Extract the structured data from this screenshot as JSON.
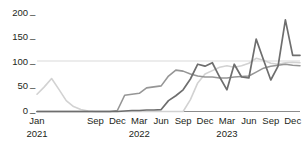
{
  "chart_data": {
    "type": "line",
    "title": "",
    "subtitle": "",
    "xlabel": "",
    "ylabel": "",
    "ylim": [
      0,
      200
    ],
    "yticks": [
      0,
      50,
      100,
      150,
      200
    ],
    "ytick_labels": [
      "0",
      "50",
      "100",
      "150",
      "200"
    ],
    "grid": "horizontal-at-100-only",
    "legend": "none",
    "x": [
      "Jan 2021",
      "Feb 2021",
      "Mar 2021",
      "Apr 2021",
      "May 2021",
      "Jun 2021",
      "Jul 2021",
      "Aug 2021",
      "Sep 2021",
      "Oct 2021",
      "Nov 2021",
      "Dec 2021",
      "Jan 2022",
      "Feb 2022",
      "Mar 2022",
      "Apr 2022",
      "May 2022",
      "Jun 2022",
      "Jul 2022",
      "Aug 2022",
      "Sep 2022",
      "Oct 2022",
      "Nov 2022",
      "Dec 2022",
      "Jan 2023",
      "Feb 2023",
      "Mar 2023",
      "Apr 2023",
      "May 2023",
      "Jun 2023",
      "Jul 2023",
      "Aug 2023",
      "Sep 2023",
      "Oct 2023",
      "Nov 2023",
      "Dec 2023",
      "Jan 2024"
    ],
    "xtick_labels": [
      "Jan",
      "Sep",
      "Dec",
      "Mar",
      "Jun",
      "Sep",
      "Dec",
      "Mar",
      "Jun",
      "Sep",
      "Dec"
    ],
    "xtick_years": [
      "2021",
      "",
      "",
      "2022",
      "",
      "",
      "",
      "2023",
      "",
      "",
      ""
    ],
    "xtick_indices": [
      0,
      8,
      11,
      14,
      17,
      20,
      23,
      26,
      29,
      32,
      35
    ],
    "series": [
      {
        "name": "series-light",
        "color": "#d2d2d2",
        "width": 1.6,
        "values": [
          35,
          50,
          67,
          45,
          22,
          10,
          4,
          1,
          0,
          0,
          0,
          0,
          0,
          0,
          0,
          0,
          0,
          0,
          0,
          0,
          0,
          24,
          58,
          76,
          83,
          90,
          93,
          90,
          93,
          98,
          108,
          104,
          98,
          96,
          99,
          100,
          99
        ]
      },
      {
        "name": "series-medium",
        "color": "#969696",
        "width": 1.6,
        "values": [
          0,
          0,
          0,
          0,
          0,
          0,
          0,
          0,
          0,
          0,
          0,
          2,
          33,
          35,
          37,
          48,
          50,
          52,
          72,
          84,
          82,
          76,
          72,
          70,
          70,
          68,
          68,
          70,
          71,
          72,
          80,
          88,
          92,
          94,
          96,
          94,
          93
        ]
      },
      {
        "name": "series-dark",
        "color": "#6e6e6e",
        "width": 1.7,
        "values": [
          0,
          0,
          0,
          0,
          0,
          0,
          0,
          0,
          0,
          0,
          0,
          0,
          1,
          2,
          2,
          3,
          3,
          4,
          22,
          32,
          44,
          66,
          96,
          92,
          99,
          70,
          44,
          96,
          70,
          68,
          147,
          105,
          64,
          92,
          186,
          114,
          114
        ]
      }
    ]
  }
}
